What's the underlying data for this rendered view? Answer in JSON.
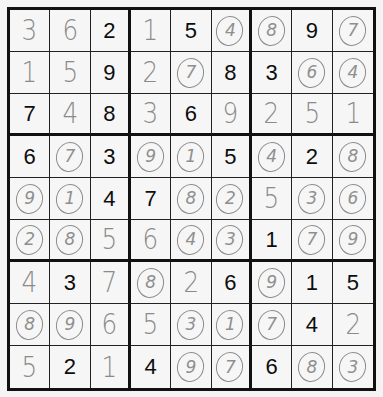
{
  "puzzle": {
    "legend": {
      "given": "printed clue",
      "hand": "handwritten entry",
      "circled": "handwritten circled entry"
    },
    "rows": [
      [
        {
          "v": "3",
          "t": "hand"
        },
        {
          "v": "6",
          "t": "hand"
        },
        {
          "v": "2",
          "t": "given"
        },
        {
          "v": "1",
          "t": "hand"
        },
        {
          "v": "5",
          "t": "given"
        },
        {
          "v": "4",
          "t": "circled"
        },
        {
          "v": "8",
          "t": "circled"
        },
        {
          "v": "9",
          "t": "given"
        },
        {
          "v": "7",
          "t": "circled"
        }
      ],
      [
        {
          "v": "1",
          "t": "hand"
        },
        {
          "v": "5",
          "t": "hand"
        },
        {
          "v": "9",
          "t": "given"
        },
        {
          "v": "2",
          "t": "hand"
        },
        {
          "v": "7",
          "t": "circled"
        },
        {
          "v": "8",
          "t": "given"
        },
        {
          "v": "3",
          "t": "given"
        },
        {
          "v": "6",
          "t": "circled"
        },
        {
          "v": "4",
          "t": "circled"
        }
      ],
      [
        {
          "v": "7",
          "t": "given"
        },
        {
          "v": "4",
          "t": "hand"
        },
        {
          "v": "8",
          "t": "given"
        },
        {
          "v": "3",
          "t": "hand"
        },
        {
          "v": "6",
          "t": "given"
        },
        {
          "v": "9",
          "t": "hand"
        },
        {
          "v": "2",
          "t": "hand"
        },
        {
          "v": "5",
          "t": "hand"
        },
        {
          "v": "1",
          "t": "hand"
        }
      ],
      [
        {
          "v": "6",
          "t": "given"
        },
        {
          "v": "7",
          "t": "circled"
        },
        {
          "v": "3",
          "t": "given"
        },
        {
          "v": "9",
          "t": "circled"
        },
        {
          "v": "1",
          "t": "circled"
        },
        {
          "v": "5",
          "t": "given"
        },
        {
          "v": "4",
          "t": "circled"
        },
        {
          "v": "2",
          "t": "given"
        },
        {
          "v": "8",
          "t": "circled"
        }
      ],
      [
        {
          "v": "9",
          "t": "circled"
        },
        {
          "v": "1",
          "t": "circled"
        },
        {
          "v": "4",
          "t": "given"
        },
        {
          "v": "7",
          "t": "given"
        },
        {
          "v": "8",
          "t": "circled"
        },
        {
          "v": "2",
          "t": "circled"
        },
        {
          "v": "5",
          "t": "hand"
        },
        {
          "v": "3",
          "t": "circled"
        },
        {
          "v": "6",
          "t": "circled"
        }
      ],
      [
        {
          "v": "2",
          "t": "circled"
        },
        {
          "v": "8",
          "t": "circled"
        },
        {
          "v": "5",
          "t": "hand"
        },
        {
          "v": "6",
          "t": "hand"
        },
        {
          "v": "4",
          "t": "circled"
        },
        {
          "v": "3",
          "t": "circled"
        },
        {
          "v": "1",
          "t": "given"
        },
        {
          "v": "7",
          "t": "circled"
        },
        {
          "v": "9",
          "t": "circled"
        }
      ],
      [
        {
          "v": "4",
          "t": "hand"
        },
        {
          "v": "3",
          "t": "given"
        },
        {
          "v": "7",
          "t": "hand"
        },
        {
          "v": "8",
          "t": "circled"
        },
        {
          "v": "2",
          "t": "hand"
        },
        {
          "v": "6",
          "t": "given"
        },
        {
          "v": "9",
          "t": "circled"
        },
        {
          "v": "1",
          "t": "given"
        },
        {
          "v": "5",
          "t": "given"
        }
      ],
      [
        {
          "v": "8",
          "t": "circled"
        },
        {
          "v": "9",
          "t": "circled"
        },
        {
          "v": "6",
          "t": "hand"
        },
        {
          "v": "5",
          "t": "hand"
        },
        {
          "v": "3",
          "t": "circled"
        },
        {
          "v": "1",
          "t": "circled"
        },
        {
          "v": "7",
          "t": "circled"
        },
        {
          "v": "4",
          "t": "given"
        },
        {
          "v": "2",
          "t": "hand"
        }
      ],
      [
        {
          "v": "5",
          "t": "hand"
        },
        {
          "v": "2",
          "t": "given"
        },
        {
          "v": "1",
          "t": "hand"
        },
        {
          "v": "4",
          "t": "given"
        },
        {
          "v": "9",
          "t": "circled"
        },
        {
          "v": "7",
          "t": "circled"
        },
        {
          "v": "6",
          "t": "given"
        },
        {
          "v": "8",
          "t": "circled"
        },
        {
          "v": "3",
          "t": "circled"
        }
      ]
    ]
  },
  "colors": {
    "given_ink": "#0d0d0d",
    "pencil_ink": "#8a8a8a",
    "grid_line": "#111111",
    "paper": "#f6f6f6"
  }
}
